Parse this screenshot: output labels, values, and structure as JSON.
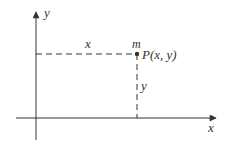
{
  "diagram": {
    "axes": {
      "x_label": "x",
      "y_label": "y"
    },
    "point": {
      "mass_label": "m",
      "name_label": "P(x, y)"
    },
    "projections": {
      "horizontal_label": "x",
      "vertical_label": "y"
    },
    "colors": {
      "ink": "#333333",
      "background": "#ffffff"
    }
  }
}
